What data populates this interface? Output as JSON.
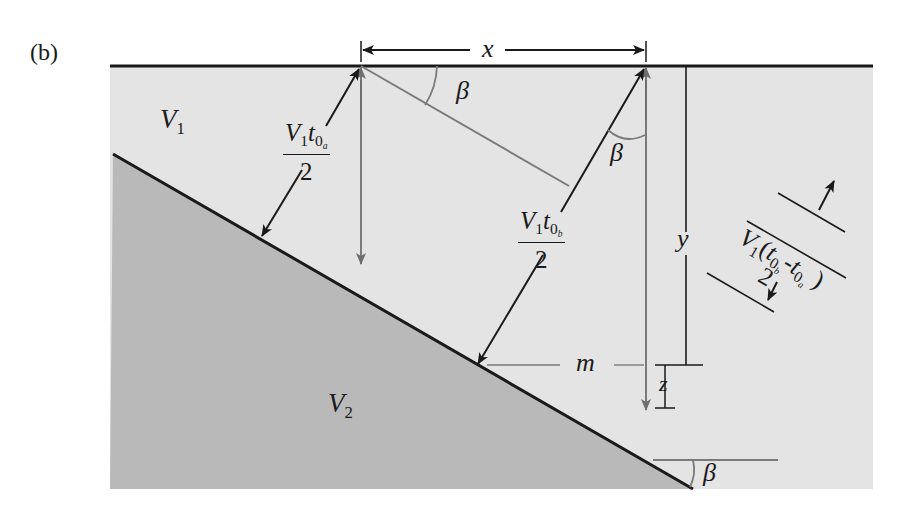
{
  "panel_label": "(b)",
  "layers": {
    "upper": {
      "name": "V",
      "subscript": "1"
    },
    "lower": {
      "name": "V",
      "subscript": "2"
    }
  },
  "dimensions": {
    "x": "x",
    "y": "y",
    "m": "m",
    "z": "z"
  },
  "angles": {
    "beta_top": "β",
    "beta_ray": "β",
    "beta_dip": "β"
  },
  "ray_a": {
    "numerator_V": "V",
    "numerator_V_sub": "1",
    "numerator_t": "t",
    "numerator_t_sub": "0",
    "numerator_t_subsub": "a",
    "denominator": "2"
  },
  "ray_b": {
    "numerator_V": "V",
    "numerator_V_sub": "1",
    "numerator_t": "t",
    "numerator_t_sub": "0",
    "numerator_t_subsub": "b",
    "denominator": "2"
  },
  "difference_label": {
    "text": "V₁(t₀b - t₀a)",
    "V": "V",
    "V_sub": "1",
    "open": "(",
    "t1": "t",
    "t1_sub": "0",
    "t1_subsub": "b",
    "minus": "-",
    "t2": "t",
    "t2_sub": "0",
    "t2_subsub": "a",
    "close": ")",
    "denominator": "2"
  },
  "colors": {
    "upper_layer": "#e4e4e4",
    "lower_layer": "#b9b9b9",
    "line_dark": "#1a1a1a",
    "line_gray": "#7a7a7a",
    "background": "#ffffff"
  }
}
